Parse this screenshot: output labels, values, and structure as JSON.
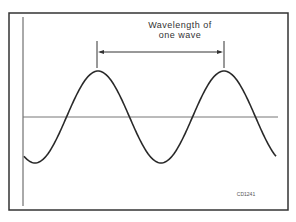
{
  "diagram": {
    "type": "sine-wave-wavelength",
    "label_line1": "Wavelength of",
    "label_line2": "one wave",
    "figure_code": "CD1241",
    "colors": {
      "line": "#2a2a2a",
      "axis": "#666666",
      "frame": "#333333",
      "background": "#ffffff"
    },
    "wave": {
      "peaks_x": [
        98,
        224
      ],
      "trough_x": [
        37,
        160
      ],
      "baseline_y": 117,
      "amplitude_px": 46
    }
  }
}
